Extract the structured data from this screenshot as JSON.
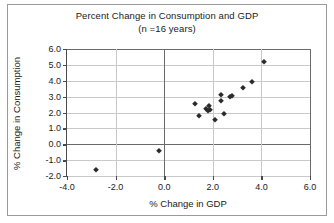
{
  "chart_data": {
    "type": "scatter",
    "title": "Percent Change in Consumption and GDP",
    "subtitle": "(n =16 years)",
    "xlabel": "% Change in GDP",
    "ylabel": "% Change in Consumption",
    "xlim": [
      -4.0,
      6.0
    ],
    "ylim": [
      -2.0,
      6.0
    ],
    "xticks": [
      "-4.0",
      "-2.0",
      "0.0",
      "2.0",
      "4.0",
      "6.0"
    ],
    "xtick_values": [
      -4.0,
      -2.0,
      0.0,
      2.0,
      4.0,
      6.0
    ],
    "yticks": [
      "-2.0",
      "-1.0",
      "0.0",
      "1.0",
      "2.0",
      "3.0",
      "4.0",
      "5.0",
      "6.0"
    ],
    "ytick_values": [
      -2.0,
      -1.0,
      0.0,
      1.0,
      2.0,
      3.0,
      4.0,
      5.0,
      6.0
    ],
    "grid": true,
    "legend": false,
    "marker": "diamond",
    "marker_color": "#2b2b2b",
    "points": [
      {
        "x": -2.8,
        "y": -1.65
      },
      {
        "x": -0.2,
        "y": -0.4
      },
      {
        "x": 1.25,
        "y": 2.55
      },
      {
        "x": 1.45,
        "y": 1.75
      },
      {
        "x": 1.7,
        "y": 2.25
      },
      {
        "x": 1.8,
        "y": 2.1
      },
      {
        "x": 1.85,
        "y": 2.4
      },
      {
        "x": 1.9,
        "y": 2.15
      },
      {
        "x": 2.1,
        "y": 1.5
      },
      {
        "x": 2.35,
        "y": 2.7
      },
      {
        "x": 2.35,
        "y": 3.1
      },
      {
        "x": 2.45,
        "y": 1.9
      },
      {
        "x": 2.7,
        "y": 3.0
      },
      {
        "x": 2.8,
        "y": 3.05
      },
      {
        "x": 3.25,
        "y": 3.55
      },
      {
        "x": 3.6,
        "y": 3.95
      },
      {
        "x": 4.1,
        "y": 5.2
      }
    ]
  }
}
